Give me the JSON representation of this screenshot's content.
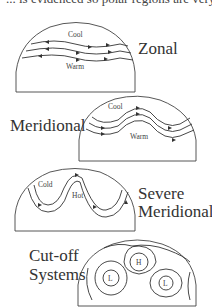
{
  "header": {
    "cut_text": "... is evidenced so polar regions are very ..."
  },
  "panels": [
    {
      "name": "Zonal",
      "label": "Zonal",
      "inner_labels": {
        "top": "Cool",
        "bottom": "Warm"
      }
    },
    {
      "name": "Meridional",
      "label": "Meridional",
      "inner_labels": {
        "top": "Cool",
        "bottom": "Warm"
      }
    },
    {
      "name": "Severe Meridional",
      "label_line1": "Severe",
      "label_line2": "Meridional",
      "inner_labels": {
        "top": "Cold",
        "bottom": "Hot"
      }
    },
    {
      "name": "Cut-off Systems",
      "label_line1": "Cut-off",
      "label_line2": "Systems",
      "inner_labels": {
        "high": "H",
        "low1": "L",
        "low2": "L"
      }
    }
  ],
  "colors": {
    "line": "#333333",
    "text": "#333333",
    "background": "#ffffff"
  }
}
